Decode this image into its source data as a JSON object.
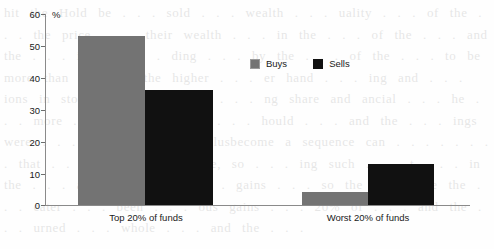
{
  "chart_data": {
    "type": "bar",
    "title": "",
    "subtitle": "",
    "xlabel": "",
    "ylabel": "%",
    "ylim": [
      0,
      60
    ],
    "yticks": [
      0,
      10,
      20,
      30,
      40,
      50,
      60
    ],
    "ytick_labels": [
      "0",
      "10",
      "20",
      "30",
      "40",
      "50",
      "60"
    ],
    "grid": false,
    "legend_position": "top-center-right",
    "categories": [
      "Top 20% of funds",
      "Worst 20% of funds"
    ],
    "series": [
      {
        "name": "Buys",
        "color": "#737373",
        "values": [
          53,
          4
        ]
      },
      {
        "name": "Sells",
        "color": "#111111",
        "values": [
          36,
          13
        ]
      }
    ]
  },
  "background_text": "hit the Hold be . . . sold . . . wealth . . . uality . . . of the . . . the price . . . their wealth . . . in the . . . of the . . . and the . . . in the . . . ding . . . by the . . . of the . . . to be more than equal to the higher . . . er hand . . . ing and . . . ions in stock of . . . to the . . . ng share and ancial . . . he . . . more . . . we . . . the . . . hould . . . and the . . . ings were . . . more than . . . ulusbecome a sequence can . . . . . . . . that . . . reason . . . more, so . . . ing such . . . t . . . in the . . . and there . . . . . . gains . . . so the . . . nce the . . . eater . . . been . . . ous gains . . . 20% of . . . and the . . . urned . . . whole . . . and the . . ."
}
